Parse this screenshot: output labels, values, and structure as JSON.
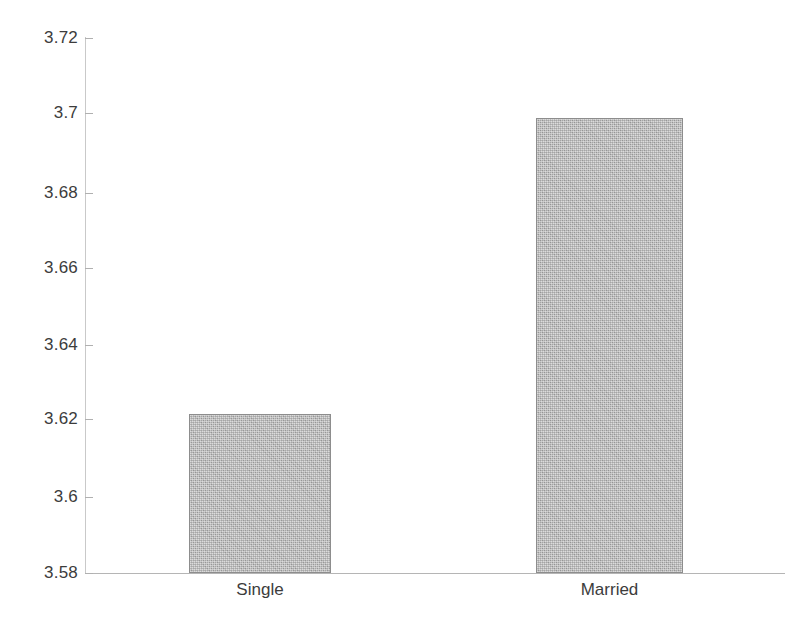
{
  "chart_data": {
    "type": "bar",
    "title": "",
    "subtitle": "",
    "xlabel": "",
    "ylabel": "",
    "categories": [
      "Single",
      "Married"
    ],
    "values": [
      3.6215,
      3.699
    ],
    "ylim": [
      3.58,
      3.72
    ],
    "ytick_labels": [
      "3.72",
      "3.7",
      "3.68",
      "3.66",
      "3.64",
      "3.62",
      "3.6",
      "3.58"
    ],
    "ytick_values": [
      3.72,
      3.7,
      3.68,
      3.66,
      3.64,
      3.62,
      3.6,
      3.58
    ],
    "grid": false,
    "legend": null,
    "annotations": [],
    "bar_fill_color": "#aeaeae",
    "bar_border_color": "#8d8d8d",
    "axis_color": "#b5b5b5",
    "background_color": "#ffffff"
  },
  "axis": {
    "ticks": [
      {
        "label": "3.72",
        "top": 38
      },
      {
        "label": "3.7",
        "top": 113
      },
      {
        "label": "3.68",
        "top": 193
      },
      {
        "label": "3.66",
        "top": 268
      },
      {
        "label": "3.64",
        "top": 345
      },
      {
        "label": "3.62",
        "top": 419
      },
      {
        "label": "3.6",
        "top": 497
      },
      {
        "label": "3.58",
        "top": 573
      }
    ]
  },
  "bars": [
    {
      "category": "Single",
      "value": 3.6215,
      "left": 189,
      "width": 142,
      "top": 414,
      "height": 159,
      "label_left": 189,
      "label_width": 142
    },
    {
      "category": "Married",
      "value": 3.699,
      "left": 536,
      "width": 147,
      "top": 118,
      "height": 455,
      "label_left": 536,
      "label_width": 147
    }
  ]
}
